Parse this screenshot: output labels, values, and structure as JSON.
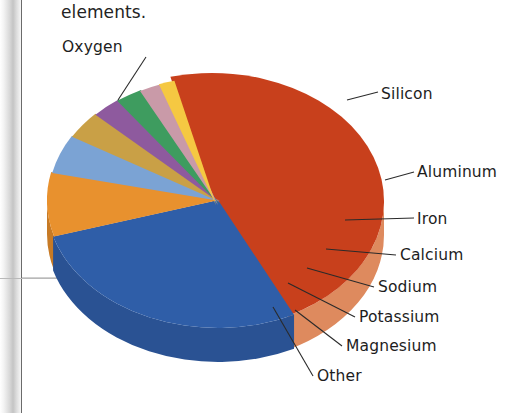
{
  "caption": {
    "text": "elements."
  },
  "chart_data": {
    "type": "pie",
    "title": "",
    "subtitle": "",
    "xlabel": "",
    "ylabel": "",
    "legend_position": "callout-labels",
    "grid": false,
    "style": "3d-exploded-tilted",
    "categories": [
      "Oxygen",
      "Silicon",
      "Aluminum",
      "Iron",
      "Calcium",
      "Sodium",
      "Potassium",
      "Magnesium",
      "Other"
    ],
    "values": [
      46.6,
      27.7,
      8.1,
      5.0,
      3.6,
      2.8,
      2.6,
      2.1,
      1.5
    ],
    "units": "percent",
    "slices": [
      {
        "label": "Oxygen",
        "value": 46.6,
        "color": "#c8401c",
        "side_color": "#de8a5e"
      },
      {
        "label": "Silicon",
        "value": 27.7,
        "color": "#2f5ea8",
        "side_color": "#2a5293"
      },
      {
        "label": "Aluminum",
        "value": 8.1,
        "color": "#e8912e",
        "side_color": "#c77a25"
      },
      {
        "label": "Iron",
        "value": 5.0,
        "color": "#7ba3d4",
        "side_color": "#6a8fbd"
      },
      {
        "label": "Calcium",
        "value": 3.6,
        "color": "#c9a046",
        "side_color": "#b08a3b"
      },
      {
        "label": "Sodium",
        "value": 2.8,
        "color": "#8e5a9e",
        "side_color": "#a77fb4"
      },
      {
        "label": "Potassium",
        "value": 2.6,
        "color": "#3e9c5f",
        "side_color": "#85bf95"
      },
      {
        "label": "Magnesium",
        "value": 2.1,
        "color": "#c99aa8",
        "side_color": "#ddb8c2"
      },
      {
        "label": "Other",
        "value": 1.5,
        "color": "#f5c842",
        "side_color": "#f2cf63"
      }
    ]
  },
  "labels": {
    "oxygen": "Oxygen",
    "silicon": "Silicon",
    "aluminum": "Aluminum",
    "iron": "Iron",
    "calcium": "Calcium",
    "sodium": "Sodium",
    "potassium": "Potassium",
    "magnesium": "Magnesium",
    "other": "Other"
  }
}
